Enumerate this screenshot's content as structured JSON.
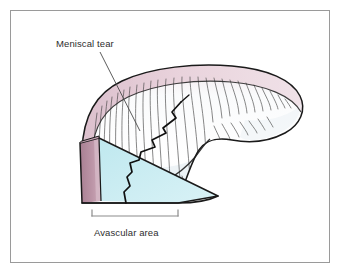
{
  "figure": {
    "domain": "medical-illustration",
    "background_color": "#ffffff",
    "frame": {
      "border_color": "#9a9a9a",
      "x": 10,
      "y": 10,
      "width": 320,
      "height": 253
    }
  },
  "labels": {
    "tear": {
      "text": "Meniscal tear",
      "color": "#2e2e2e",
      "x": 56,
      "y": 39
    },
    "avascular": {
      "text": "Avascular area",
      "color": "#2e2e2e",
      "x": 94,
      "y": 228
    }
  },
  "leader_line": {
    "color": "#4a4a4a",
    "from_x": 100,
    "from_y": 52,
    "to_x": 138,
    "to_y": 133
  },
  "bracket": {
    "color": "#8c8c8c",
    "left_x": 92,
    "right_x": 178,
    "y": 216,
    "tick_height": 6
  },
  "colors": {
    "outline": "#1a1a1a",
    "vascular_band": "#b18a9c",
    "vascular_band_light": "#cfaebc",
    "top_rim_pink": "#e7cfd8",
    "avascular_fill": "#c9ecf2",
    "body_fill": "#fbfcfd",
    "body_shade": "#eef2f6",
    "striation": "#3a3a3a",
    "tear": "#111111"
  },
  "anatomy": {
    "regions": [
      {
        "name": "vascular-zone",
        "description": "Red-pink peripheral band at cut face",
        "color": "#b18a9c"
      },
      {
        "name": "avascular-zone",
        "description": "Pale blue inner wedge at cut face",
        "color": "#c9ecf2"
      },
      {
        "name": "superior-surface",
        "description": "Pink-tinged upper rim of meniscus body",
        "color": "#e7cfd8"
      },
      {
        "name": "meniscus-body",
        "description": "Striated fibrocartilage body",
        "color": "#fbfcfd"
      }
    ],
    "tear_type": "radial / vertical tear extending from superior surface through to inferior border"
  }
}
